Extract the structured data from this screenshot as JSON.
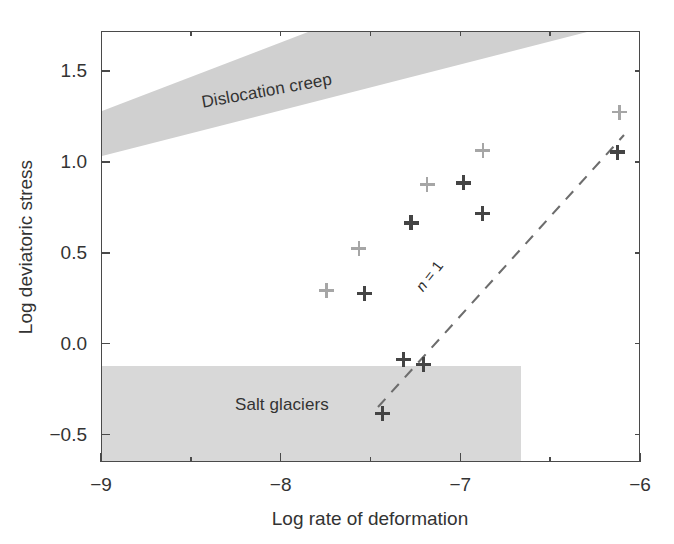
{
  "chart_data": {
    "type": "scatter",
    "title": "",
    "xlabel": "Log rate of deformation",
    "ylabel": "Log deviatoric stress",
    "xlim": [
      -9.0,
      -6.0
    ],
    "ylim": [
      -0.65,
      1.72
    ],
    "grid": false,
    "legend": null,
    "x_ticks": [
      -9,
      -8,
      -7,
      -6
    ],
    "x_tick_labels": [
      "−9",
      "−8",
      "−7",
      "−6"
    ],
    "x_minor_ticks": [
      -8.5,
      -7.5,
      -6.5
    ],
    "y_ticks": [
      -0.5,
      0.0,
      0.5,
      1.0,
      1.5
    ],
    "y_tick_labels": [
      "−0.5",
      "0.0",
      "0.5",
      "1.0",
      "1.5"
    ],
    "series": [
      {
        "name": "light-markers",
        "marker": "plus",
        "color": "#a6a6a6",
        "points": [
          {
            "x": -7.75,
            "y": 0.3
          },
          {
            "x": -7.57,
            "y": 0.53
          },
          {
            "x": -7.19,
            "y": 0.88
          },
          {
            "x": -6.88,
            "y": 1.07
          },
          {
            "x": -6.12,
            "y": 1.28
          }
        ]
      },
      {
        "name": "dark-markers",
        "marker": "plus",
        "color": "#444444",
        "points": [
          {
            "x": -7.54,
            "y": 0.28
          },
          {
            "x": -7.28,
            "y": 0.67
          },
          {
            "x": -6.99,
            "y": 0.89
          },
          {
            "x": -6.88,
            "y": 0.72
          },
          {
            "x": -6.13,
            "y": 1.06
          },
          {
            "x": -7.32,
            "y": -0.08
          },
          {
            "x": -7.21,
            "y": -0.11
          },
          {
            "x": -7.44,
            "y": -0.38
          }
        ]
      }
    ],
    "annotations": [
      {
        "name": "n1-line-label",
        "text_prefix": "n",
        "text_suffix": " = 1",
        "rotation_deg": -52
      },
      {
        "name": "dislocation-creep-band-label",
        "text": "Dislocation creep",
        "rotation_deg": -10.2
      },
      {
        "name": "salt-glaciers-box-label",
        "text": "Salt glaciers",
        "rotation_deg": 0
      }
    ],
    "shaded_regions": [
      {
        "name": "dislocation-creep",
        "label": "Dislocation creep",
        "color": "#d0d0d0",
        "shape": "band",
        "lower_edge": [
          {
            "x": -9.0,
            "y": 1.08
          },
          {
            "x": -6.31,
            "y": 1.72
          }
        ],
        "upper_edge": [
          {
            "x": -9.0,
            "y": 1.33
          },
          {
            "x": -7.44,
            "y": 1.72
          }
        ]
      },
      {
        "name": "salt-glaciers",
        "label": "Salt glaciers",
        "color": "#d8d8d8",
        "shape": "rectangle",
        "x_range": [
          -9.0,
          -6.67
        ],
        "y_range": [
          -0.65,
          -0.15
        ]
      }
    ],
    "reference_lines": [
      {
        "name": "n-equals-1",
        "label": "n = 1",
        "style": "dashed",
        "color": "#6d6d6d",
        "from": {
          "x": -7.47,
          "y": -0.42
        },
        "to": {
          "x": -6.1,
          "y": 1.09
        }
      }
    ]
  },
  "axes": {
    "x_title": "Log rate of deformation",
    "y_title": "Log deviatoric stress",
    "x_tick_labels": [
      "−9",
      "−8",
      "−7",
      "−6"
    ],
    "y_tick_labels": [
      "1.5",
      "1.0",
      "0.5",
      "0.0",
      "−0.5"
    ]
  },
  "labels": {
    "dislocation_creep": "Dislocation creep",
    "salt_glaciers": "Salt glaciers",
    "n_symbol": "n",
    "n_value": " = 1"
  },
  "colors": {
    "band_dislocation": "#d0d0d0",
    "box_salt": "#d8d8d8",
    "marker_light": "#a6a6a6",
    "marker_dark": "#444444",
    "axis": "#4a4a4a",
    "text": "#333333"
  }
}
